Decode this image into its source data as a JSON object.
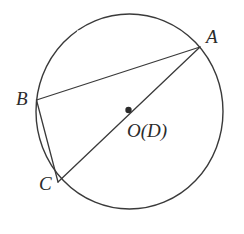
{
  "figure": {
    "type": "circle-geometry-diagram",
    "canvas": {
      "width": 244,
      "height": 234,
      "background": "#ffffff"
    },
    "stroke_color": "#3a3a3a",
    "text_color": "#2b2b2b",
    "circle": {
      "name": "main-circle",
      "center_x": 129.5,
      "center_y": 111.5,
      "radius_x": 93.5,
      "radius_y": 97.5,
      "stroke_width": 1.4
    },
    "center_point": {
      "name": "center-dot",
      "x": 128.5,
      "y": 110,
      "radius": 3.2,
      "label": "O(D)",
      "label_x": 127,
      "label_y": 121
    },
    "points": [
      {
        "id": "A",
        "label": "A",
        "x": 200,
        "y": 47,
        "label_x": 206,
        "label_y": 27
      },
      {
        "id": "B",
        "label": "B",
        "x": 36.5,
        "y": 100,
        "label_x": 16,
        "label_y": 89
      },
      {
        "id": "C",
        "label": "C",
        "x": 58,
        "y": 182,
        "label_x": 39,
        "label_y": 174
      }
    ],
    "segments": [
      {
        "name": "chord-BA",
        "from": "B",
        "to": "A",
        "x1": 36.5,
        "y1": 100,
        "x2": 200,
        "y2": 47
      },
      {
        "name": "chord-BC",
        "from": "B",
        "to": "C",
        "x1": 36.5,
        "y1": 100,
        "x2": 58,
        "y2": 182
      },
      {
        "name": "diameter-CA",
        "from": "C",
        "to": "A",
        "x1": 58,
        "y1": 182,
        "x2": 200,
        "y2": 47
      }
    ],
    "arc_gaps": [
      {
        "name": "arc-gap-upper-left",
        "x": 77,
        "y": 30.5,
        "width": 5,
        "height": 4
      },
      {
        "name": "arc-gap-upper-right",
        "x": 182,
        "y": 25.5,
        "width": 5,
        "height": 4
      }
    ]
  }
}
